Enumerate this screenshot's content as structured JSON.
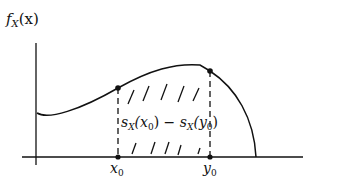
{
  "diagram": {
    "y_axis_label": "f",
    "y_axis_label_sub": "X",
    "y_axis_label_arg": "(x)",
    "x0_label": "x",
    "x0_sub": "0",
    "y0_label": "y",
    "y0_sub": "0",
    "region_label": {
      "s1": "s",
      "s1_sub": "X",
      "s1_arg_open": "(x",
      "s1_arg_sub": "0",
      "s1_arg_close": ")",
      "minus": " − ",
      "s2": "s",
      "s2_sub": "X",
      "s2_arg_open": "(y",
      "s2_arg_sub": "0",
      "s2_arg_close": ")"
    },
    "colors": {
      "line": "#111111",
      "background": "#ffffff"
    }
  }
}
